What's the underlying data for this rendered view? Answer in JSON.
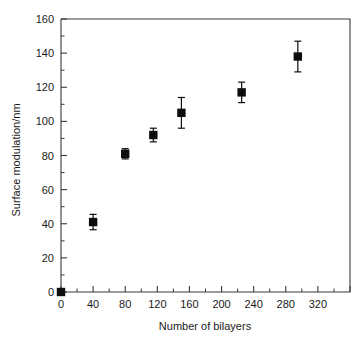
{
  "chart_data": {
    "type": "scatter",
    "title": "",
    "xlabel": "Number of bilayers",
    "ylabel": "Surface modulation/nm",
    "xlim": [
      0,
      360
    ],
    "ylim": [
      0,
      160
    ],
    "x_major_step": 40,
    "x_minor_step": 20,
    "y_major_step": 20,
    "y_minor_step": 10,
    "grid": false,
    "legend": false,
    "legend_position": "none",
    "marker_style": "filled-square",
    "error_bars": "symmetric-y",
    "xticks": [
      0,
      40,
      80,
      120,
      160,
      200,
      240,
      280,
      320
    ],
    "xtick_labels": [
      "0",
      "40",
      "80",
      "120",
      "160",
      "200",
      "240",
      "280",
      "320"
    ],
    "yticks": [
      0,
      20,
      40,
      60,
      80,
      100,
      120,
      140,
      160
    ],
    "ytick_labels": [
      "0",
      "20",
      "40",
      "60",
      "80",
      "100",
      "120",
      "140",
      "160"
    ],
    "series": [
      {
        "name": "Surface modulation",
        "points": [
          {
            "x": 0,
            "y": 0,
            "yerr": 0
          },
          {
            "x": 40,
            "y": 41,
            "yerr": 4.5
          },
          {
            "x": 80,
            "y": 81,
            "yerr": 3
          },
          {
            "x": 115,
            "y": 92,
            "yerr": 4
          },
          {
            "x": 150,
            "y": 105,
            "yerr": 9
          },
          {
            "x": 225,
            "y": 117,
            "yerr": 6
          },
          {
            "x": 295,
            "y": 138,
            "yerr": 9
          }
        ]
      }
    ]
  },
  "figure": {
    "background_color": "#ffffff",
    "axis_color": "#3a3a3a",
    "marker_color": "#0d0d0d",
    "text_color": "#1a1a1a"
  }
}
